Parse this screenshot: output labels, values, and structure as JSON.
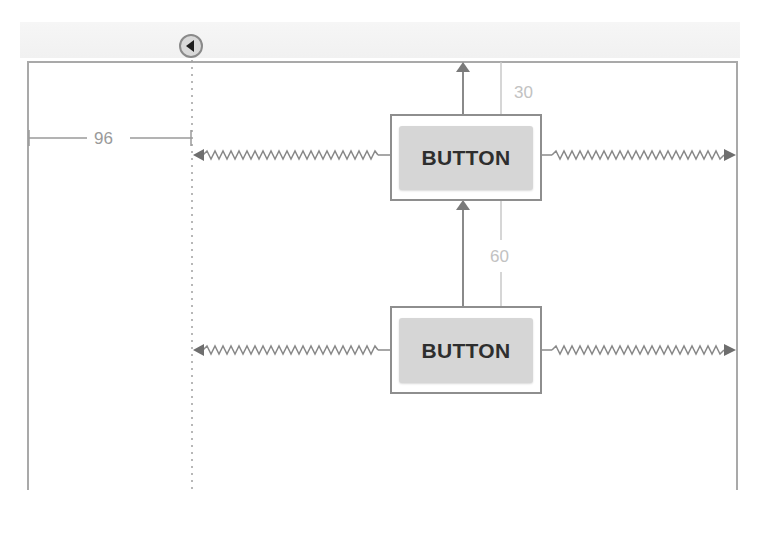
{
  "editor": {
    "type": "layout-constraint-editor",
    "guideline": {
      "orientation": "vertical",
      "offset_label": "96",
      "handle_icon": "chevron-left-icon"
    },
    "widgets": [
      {
        "id": "button-1",
        "label": "BUTTON",
        "top_margin_label": "30",
        "constraints": [
          "top-to-parent",
          "left-to-guideline",
          "right-to-parent"
        ]
      },
      {
        "id": "button-2",
        "label": "BUTTON",
        "top_margin_label": "60",
        "constraints": [
          "top-to-button-1-bottom",
          "left-to-guideline",
          "right-to-parent"
        ]
      }
    ],
    "colors": {
      "border": "#8e8e8e",
      "widget_fill": "#d6d6d6",
      "constraint_line": "#8a8a8a",
      "label_text": "#9a9a9a",
      "margin_text": "#c2c2c2"
    }
  }
}
